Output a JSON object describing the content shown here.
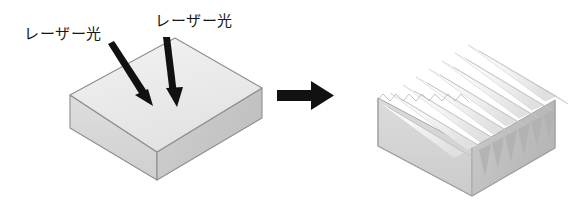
{
  "figure": {
    "background_color": "#ffffff",
    "width": 588,
    "height": 210
  },
  "labels": {
    "laser_left": "レーザー光",
    "laser_right": "レーザー光"
  },
  "colors": {
    "arrow_black": "#111111",
    "outline": "#8e8e8e",
    "slab_top": "#ebebeb",
    "slab_front": "#d8d8d8",
    "slab_side": "#c9c9c9",
    "ridge_light": "#fbfbfb",
    "ridge_mid": "#e9e9e9",
    "ridge_shadow": "#c2c2c2",
    "grooved_front": "#d3d3d3",
    "grooved_side": "#bdbdbd"
  },
  "left_object": {
    "name": "flat-slab",
    "description": "Flat rectangular slab in oblique projection with smooth top surface",
    "top_face": [
      [
        70,
        95
      ],
      [
        175,
        38
      ],
      [
        262,
        88
      ],
      [
        157,
        152
      ]
    ],
    "front_face": [
      [
        70,
        95
      ],
      [
        70,
        128
      ],
      [
        157,
        180
      ],
      [
        157,
        152
      ]
    ],
    "side_face": [
      [
        157,
        152
      ],
      [
        157,
        180
      ],
      [
        262,
        118
      ],
      [
        262,
        88
      ]
    ]
  },
  "laser_arrows": [
    {
      "name": "laser-beam-left",
      "start": [
        110,
        47
      ],
      "end": [
        152,
        105
      ],
      "color": "#111111"
    },
    {
      "name": "laser-beam-right",
      "start": [
        166,
        38
      ],
      "end": [
        176,
        106
      ],
      "color": "#111111"
    }
  ],
  "process_arrow": {
    "name": "process-arrow",
    "direction": "right",
    "start": [
      277,
      95
    ],
    "end": [
      332,
      95
    ],
    "color": "#111111"
  },
  "right_object": {
    "name": "grooved-block",
    "description": "Block with periodic sawtooth ridge microstructure on the top surface",
    "ridge_count": 8,
    "top_back_left": [
      378,
      98
    ],
    "top_back_right": [
      478,
      42
    ],
    "top_front_right": [
      555,
      88
    ],
    "top_front_left": [
      455,
      148
    ],
    "bottom_front": [
      472,
      196
    ],
    "front_face_depth": 48
  }
}
